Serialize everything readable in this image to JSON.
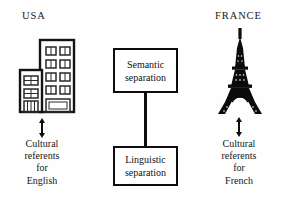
{
  "page": {
    "background_color": "#fefefe",
    "ink_color": "#111111"
  },
  "header": {
    "clipped_top_line": "",
    "note": "top line of text is cropped off by the image edge and unreadable"
  },
  "columns": {
    "left": {
      "country_label": "USA",
      "icon": "office-building-icon",
      "arrow": "double-headed-vertical-arrow",
      "caption_lines": [
        "Cultural",
        "referents",
        "for",
        "English"
      ]
    },
    "right": {
      "country_label": "FRANCE",
      "icon": "eiffel-tower-icon",
      "arrow": "double-headed-vertical-arrow",
      "caption_lines": [
        "Cultural",
        "referents",
        "for",
        "French"
      ]
    }
  },
  "center": {
    "boxes": [
      {
        "line1": "Semantic",
        "line2": "separation"
      },
      {
        "line1": "Linguistic",
        "line2": "separation"
      }
    ],
    "connector": "vertical-line"
  },
  "colors": {
    "stroke": "#0d0d0d",
    "box_fill": "#ffffff",
    "text": "#111111"
  }
}
